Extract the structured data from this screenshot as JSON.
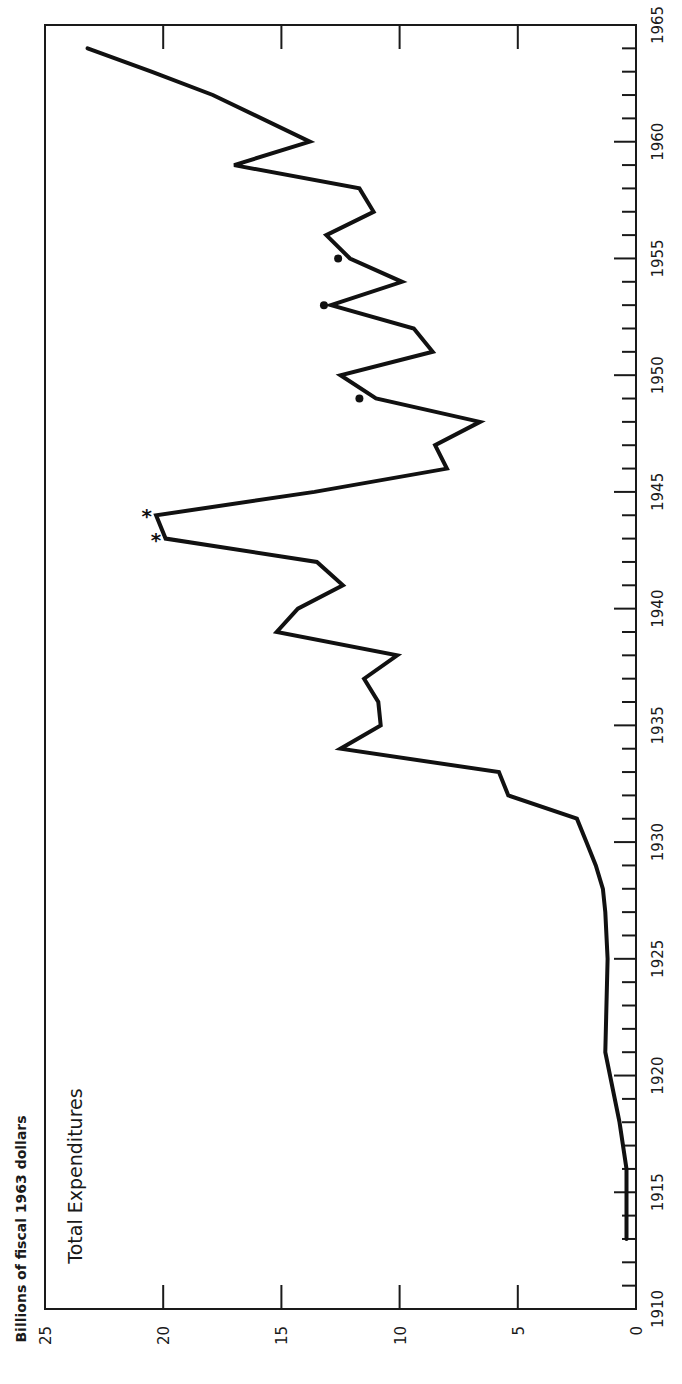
{
  "chart_data": {
    "type": "line",
    "orientation": "rotated-90-ccw",
    "title": "Total Expenditures",
    "xlabel": "",
    "ylabel": "Billions of fiscal 1963 dollars",
    "xlim": [
      1910,
      1965
    ],
    "ylim": [
      0,
      25
    ],
    "x_ticks_major": [
      1910,
      1915,
      1920,
      1925,
      1930,
      1935,
      1940,
      1945,
      1950,
      1955,
      1960,
      1965
    ],
    "x_tick_labels": [
      "1910",
      "1915",
      "1920",
      "1925",
      "1930",
      "1935",
      "1940",
      "1945",
      "1950",
      "1955",
      "1960",
      "1965"
    ],
    "y_ticks": [
      0,
      5,
      10,
      15,
      20,
      25
    ],
    "y_tick_labels": [
      "0",
      "5",
      "10",
      "15",
      "20",
      "25"
    ],
    "grid": false,
    "legend": null,
    "series": [
      {
        "name": "Total Expenditures",
        "x": [
          1913,
          1916,
          1918,
          1921,
          1925,
          1927,
          1928,
          1929,
          1930,
          1931,
          1932,
          1933,
          1934,
          1935,
          1936,
          1937,
          1938,
          1939,
          1940,
          1941,
          1942,
          1943,
          1944,
          1945,
          1946,
          1947,
          1948,
          1949,
          1950,
          1951,
          1952,
          1953,
          1954,
          1955,
          1956,
          1957,
          1958,
          1959,
          1960,
          1962,
          1963,
          1964
        ],
        "values": [
          0.4,
          0.4,
          0.7,
          1.3,
          1.2,
          1.3,
          1.4,
          1.7,
          2.1,
          2.5,
          5.4,
          5.8,
          12.5,
          10.8,
          10.9,
          11.5,
          10.1,
          15.2,
          14.3,
          12.4,
          13.5,
          19.9,
          20.3,
          13.6,
          8.0,
          8.5,
          6.6,
          11.0,
          12.5,
          8.6,
          9.4,
          12.9,
          9.9,
          12.1,
          13.1,
          11.1,
          11.7,
          17.0,
          13.8,
          17.9,
          20.5,
          23.2
        ]
      }
    ],
    "annotations": [
      {
        "type": "asterisk",
        "x": 1943,
        "y": 20.3,
        "text": "*"
      },
      {
        "type": "asterisk",
        "x": 1944,
        "y": 20.7,
        "text": "*"
      },
      {
        "type": "dot",
        "x": 1949,
        "y": 11.7
      },
      {
        "type": "dot",
        "x": 1953,
        "y": 13.2
      },
      {
        "type": "dot",
        "x": 1955,
        "y": 12.6
      }
    ]
  }
}
